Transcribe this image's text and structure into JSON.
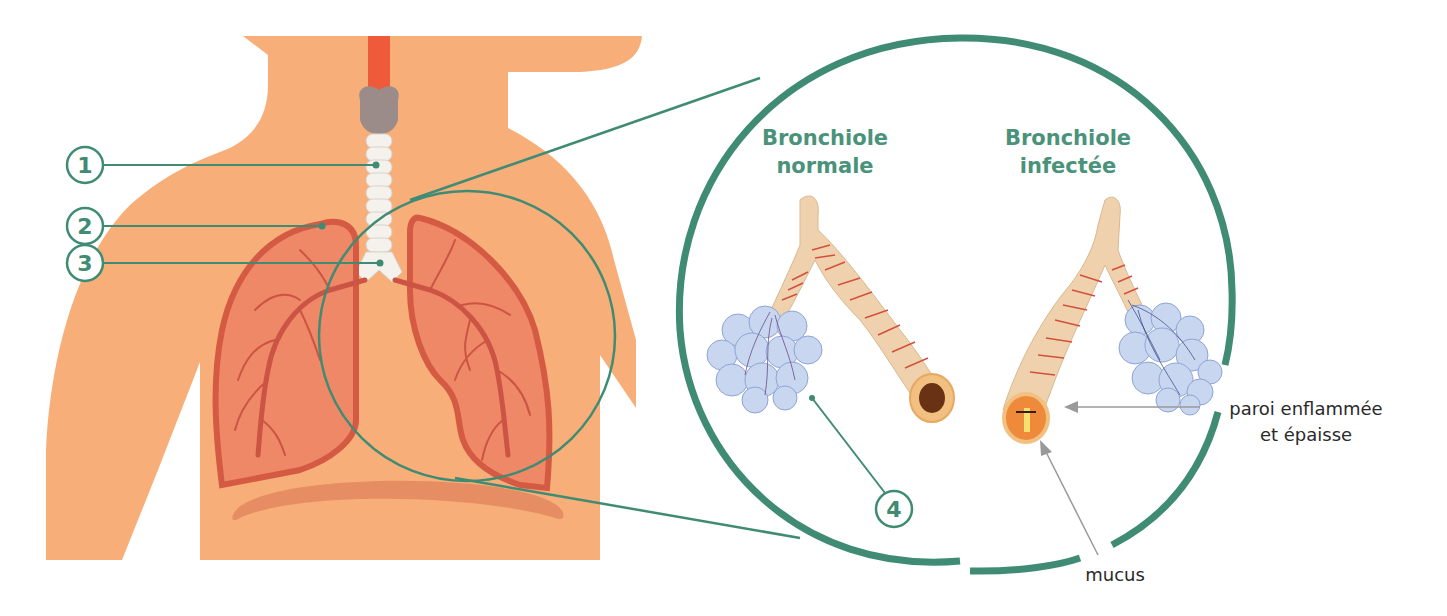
{
  "diagram": {
    "topic": "respiratory-system",
    "colors": {
      "body": "#f7ae78",
      "lung_fill": "#ee8866",
      "lung_outline": "#d55a44",
      "trachea": "#f5f2ee",
      "larynx": "#9c8c89",
      "pharynx": "#ee5a3a",
      "diaphragm": "#e48a60",
      "accent_green": "#3f8b73",
      "pointer_gray": "#999999"
    },
    "numbered_labels": [
      {
        "id": "1",
        "text": "1",
        "target": "trachea"
      },
      {
        "id": "2",
        "text": "2",
        "target": "lung"
      },
      {
        "id": "3",
        "text": "3",
        "target": "bronchus"
      },
      {
        "id": "4",
        "text": "4",
        "target": "alveoli"
      }
    ],
    "zoom_panel": {
      "normal": {
        "title_line1": "Bronchiole",
        "title_line2": "normale"
      },
      "infected": {
        "title_line1": "Bronchiole",
        "title_line2": "infectée"
      }
    },
    "annotations": {
      "wall_line1": "paroi enflammée",
      "wall_line2": "et épaisse",
      "mucus": "mucus"
    }
  }
}
